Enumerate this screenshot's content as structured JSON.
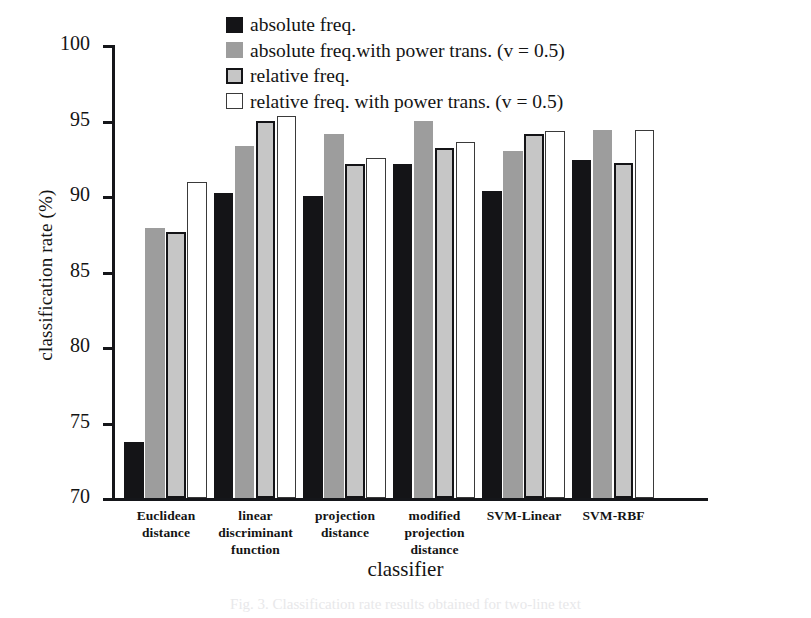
{
  "figure": {
    "caption": "Fig. 3.  Classification rate results obtained for two-line text",
    "ylabel": "classification rate (%)",
    "xlabel": "classifier"
  },
  "colors": {
    "series_absolute_freq": "#141417",
    "series_absolute_freq_power": "#9d9d9d",
    "series_relative_freq": "#c6c6c6",
    "series_relative_freq_power": "#ffffff",
    "axis": "#15161a"
  },
  "legend": {
    "position": "top-center",
    "entries": [
      {
        "label": "absolute freq.",
        "swatch": "solid-black"
      },
      {
        "label": "absolute freq.with power trans. (v = 0.5)",
        "swatch": "solid-gray"
      },
      {
        "label": "relative freq.",
        "swatch": "light-gray-outlined"
      },
      {
        "label": "relative freq. with power trans. (v = 0.5)",
        "swatch": "white-outlined"
      }
    ]
  },
  "yaxis": {
    "ticks": [
      "100",
      "95",
      "90",
      "85",
      "80",
      "75",
      "70"
    ]
  },
  "chart_data": {
    "type": "bar",
    "title": "",
    "xlabel": "classifier",
    "ylabel": "classification rate (%)",
    "ylim": [
      70,
      100
    ],
    "ytick_step": 5,
    "grid": false,
    "legend_position": "top-center",
    "categories": [
      "Euclidean distance",
      "linear discriminant function",
      "projection distance",
      "modified projection distance",
      "SVM-Linear",
      "SVM-RBF"
    ],
    "category_lines": [
      [
        "Euclidean",
        "distance"
      ],
      [
        "linear",
        "discriminant",
        "function"
      ],
      [
        "projection",
        "distance"
      ],
      [
        "modified",
        "projection",
        "distance"
      ],
      [
        "SVM-Linear"
      ],
      [
        "SVM-RBF"
      ]
    ],
    "series": [
      {
        "name": "absolute freq.",
        "values": [
          73.7,
          90.2,
          90.0,
          92.1,
          90.3,
          92.4
        ]
      },
      {
        "name": "absolute freq.with power trans. (v = 0.5)",
        "values": [
          87.9,
          93.3,
          94.1,
          95.0,
          93.0,
          94.4
        ]
      },
      {
        "name": "relative freq.",
        "values": [
          87.6,
          95.0,
          92.1,
          93.2,
          94.1,
          92.2
        ]
      },
      {
        "name": "relative freq. with power trans. (v = 0.5)",
        "values": [
          90.9,
          95.3,
          92.5,
          93.6,
          94.3,
          94.4
        ]
      }
    ]
  }
}
